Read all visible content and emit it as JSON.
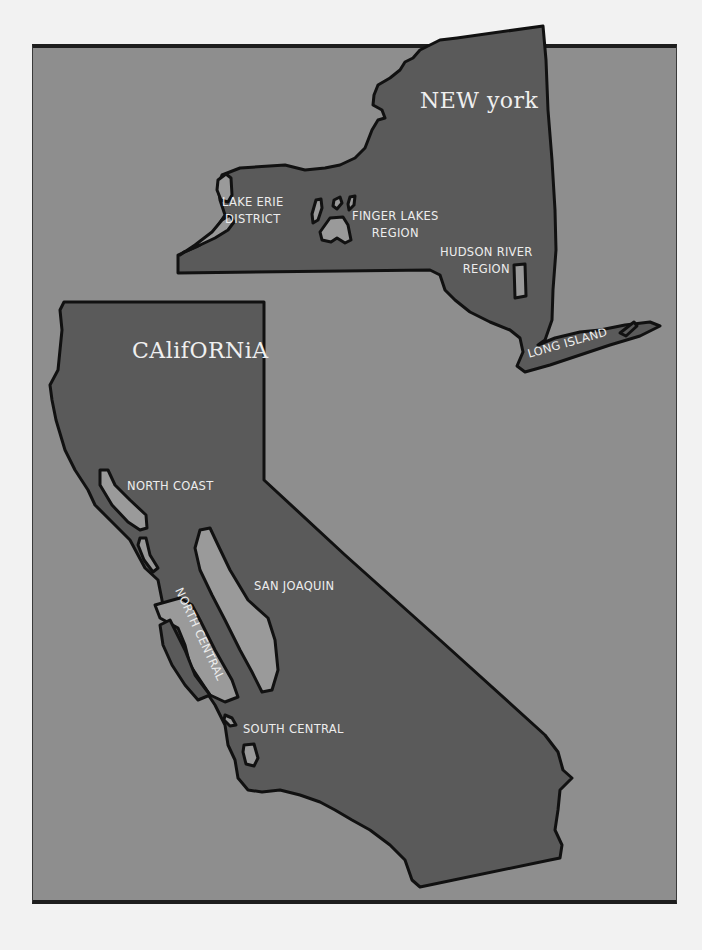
{
  "map": {
    "colors": {
      "page_background": "#f2f2f2",
      "frame_background": "#8e8e8e",
      "state_fill": "#5a5a5a",
      "region_fill": "#9a9a9a",
      "outline": "#111111",
      "label_text": "#ededed"
    },
    "states": [
      {
        "name": "New York",
        "title": "NEW york",
        "regions": [
          {
            "label_line1": "LAKE ERIE",
            "label_line2": "DISTRICT"
          },
          {
            "label_line1": "FINGER LAKES",
            "label_line2": "REGION"
          },
          {
            "label_line1": "HUDSON RIVER",
            "label_line2": "REGION"
          },
          {
            "label_line1": "LONG ISLAND",
            "label_line2": ""
          }
        ]
      },
      {
        "name": "California",
        "title": "CAlifORNiA",
        "regions": [
          {
            "label_line1": "NORTH COAST"
          },
          {
            "label_line1": "SAN JOAQUIN"
          },
          {
            "label_line1": "NORTH CENTRAL"
          },
          {
            "label_line1": "SOUTH CENTRAL"
          }
        ]
      }
    ]
  }
}
